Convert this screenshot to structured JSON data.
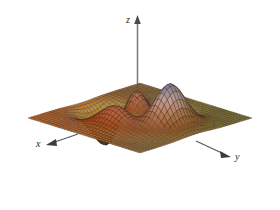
{
  "figure": {
    "title": "",
    "background_color": "#ffffff",
    "axes": {
      "z": {
        "label": "z",
        "arrow": "up-arrow-icon",
        "color": "#7a7a7a"
      },
      "x": {
        "label": "x",
        "arrow": "left-arrow-icon",
        "color": "#5a5a5a"
      },
      "y": {
        "label": "y",
        "arrow": "right-arrow-icon",
        "color": "#5a5a5a"
      }
    }
  },
  "chart_data": {
    "type": "surface",
    "title": "",
    "xlabel": "x",
    "ylabel": "y",
    "zlabel": "z",
    "projection": "3d-wireframe-surface",
    "grid": true,
    "legend": "none",
    "xlim": [
      -3,
      3
    ],
    "ylim": [
      -3,
      3
    ],
    "zlim": [
      -7,
      8
    ],
    "grid_n": 38,
    "function": "peaks",
    "formula": "z = 3*(1-x)^2*exp(-x^2-(y+1)^2) - 10*(x/5 - x^3 - y^5)*exp(-x^2-y^2) - (1/3)*exp(-(x+1)^2 - y^2)",
    "features": [
      {
        "name": "left-peak",
        "x": -0.7,
        "y": 1.3,
        "z": 7.9,
        "color": "#b08a86"
      },
      {
        "name": "right-peak",
        "x": 0.9,
        "y": -1.2,
        "z": 7.2,
        "color": "#7e7390"
      },
      {
        "name": "front-valley",
        "x": 0.3,
        "y": -1.6,
        "z": -6.5,
        "color": "#b3a24a"
      },
      {
        "name": "base-plane-left",
        "z": 0,
        "color": "#8a3a18"
      },
      {
        "name": "base-plane-right",
        "z": 0,
        "color": "#2b3a22"
      }
    ],
    "colormap": {
      "name": "warm-cool-terrain",
      "stops": [
        {
          "t": 0.0,
          "color": "#2d3a23"
        },
        {
          "t": 0.2,
          "color": "#6b6a2e"
        },
        {
          "t": 0.38,
          "color": "#9c8f4a"
        },
        {
          "t": 0.52,
          "color": "#8c4a22"
        },
        {
          "t": 0.68,
          "color": "#a3674a"
        },
        {
          "t": 0.84,
          "color": "#b08a86"
        },
        {
          "t": 1.0,
          "color": "#7d7490"
        }
      ]
    },
    "mesh_line_color": "#3a2a20",
    "view": {
      "azimuth": 225,
      "elevation": 28
    }
  }
}
